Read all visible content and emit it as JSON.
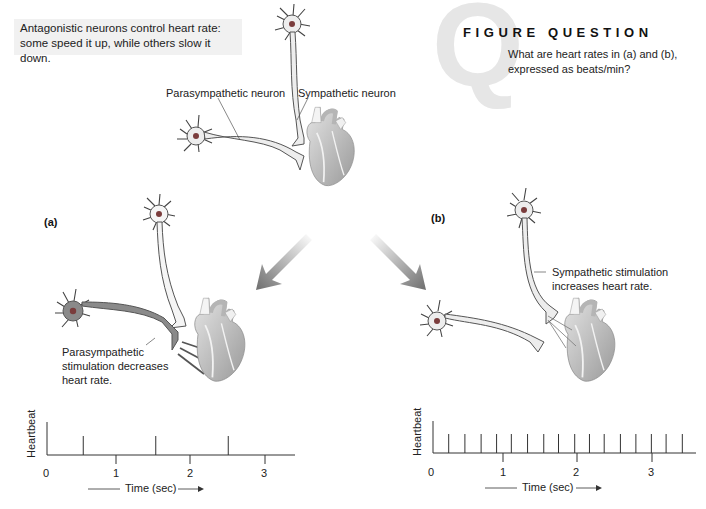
{
  "intro": {
    "line1": "Antagonistic neurons control heart rate:",
    "line2": "some speed it up, while others slow it down."
  },
  "figure_question": {
    "badge_letter": "Q",
    "title": "FIGURE QUESTION",
    "line1": "What are heart rates in (a) and (b),",
    "line2": "expressed as beats/min?"
  },
  "top_labels": {
    "parasympathetic": "Parasympathetic neuron",
    "sympathetic": "Sympathetic neuron"
  },
  "panel_a": {
    "label": "(a)",
    "callout_line1": "Parasympathetic",
    "callout_line2": "stimulation decreases",
    "callout_line3": "heart rate."
  },
  "panel_b": {
    "label": "(b)",
    "callout_line1": "Sympathetic stimulation",
    "callout_line2": "increases heart rate."
  },
  "colors": {
    "neuron_light_fill": "#ededed",
    "neuron_dark_fill": "#8a8a8a",
    "nucleus": "#7a3c3c",
    "arrow_gradient_end": "#6e6e6e",
    "axis": "#333333"
  },
  "chart_data": [
    {
      "type": "line",
      "title": "(a) Parasympathetic stimulation",
      "xlabel": "Time (sec)",
      "ylabel": "Heartbeat",
      "x_ticks": [
        "0",
        "1",
        "2",
        "3"
      ],
      "xlim": [
        0,
        3.2
      ],
      "beats_sec": [
        0.5,
        1.5,
        2.5
      ],
      "beats_per_min": 60
    },
    {
      "type": "line",
      "title": "(b) Sympathetic stimulation",
      "xlabel": "Time (sec)",
      "ylabel": "Heartbeat",
      "x_ticks": [
        "0",
        "1",
        "2",
        "3"
      ],
      "xlim": [
        0,
        3.5
      ],
      "beats_sec": [
        0.24,
        0.46,
        0.68,
        0.89,
        1.09,
        1.31,
        1.53,
        1.73,
        1.95,
        2.15,
        2.35,
        2.57,
        2.78,
        2.99,
        3.19,
        3.41
      ],
      "beats_per_min": 280
    }
  ],
  "charts": {
    "a": {
      "ylabel": "Heartbeat",
      "xlabel": "Time (sec)",
      "t0": "0",
      "t1": "1",
      "t2": "2",
      "t3": "3"
    },
    "b": {
      "ylabel": "Heartbeat",
      "xlabel": "Time (sec)",
      "t0": "0",
      "t1": "1",
      "t2": "2",
      "t3": "3"
    }
  }
}
